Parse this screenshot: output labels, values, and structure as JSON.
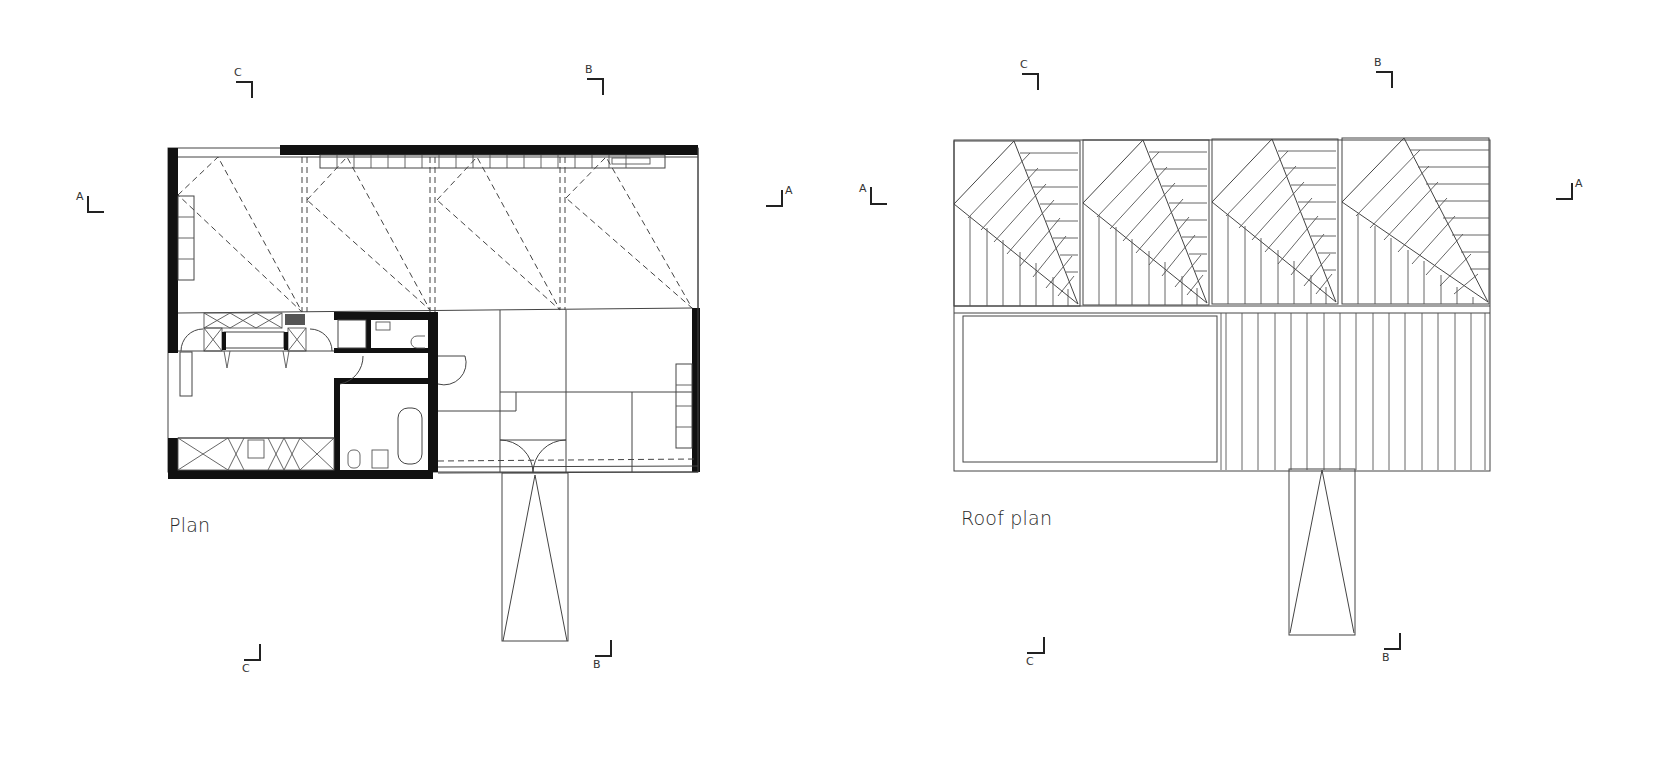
{
  "drawings": [
    {
      "id": "plan",
      "caption": "Plan",
      "section_markers": {
        "top": [
          "C",
          "B"
        ],
        "sides": [
          "A",
          "A"
        ],
        "bottom": [
          "C",
          "B"
        ]
      }
    },
    {
      "id": "roof_plan",
      "caption": "Roof plan",
      "section_markers": {
        "top": [
          "C",
          "B"
        ],
        "sides": [
          "A",
          "A"
        ],
        "bottom": [
          "C",
          "B"
        ]
      }
    }
  ],
  "labels": {
    "plan_caption": "Plan",
    "roof_caption": "Roof plan",
    "plan_top_c": "C",
    "plan_top_b": "B",
    "plan_left_a": "A",
    "plan_right_a": "A",
    "plan_bottom_c": "C",
    "plan_bottom_b": "B",
    "roof_top_c": "C",
    "roof_top_b": "B",
    "roof_left_a": "A",
    "roof_right_a": "A",
    "roof_bottom_c": "C",
    "roof_bottom_b": "B"
  },
  "colors": {
    "background": "#ffffff",
    "line": "#444444",
    "wall": "#111111"
  }
}
